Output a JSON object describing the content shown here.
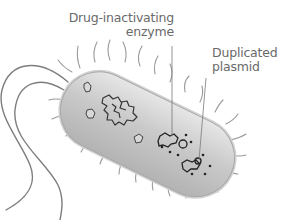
{
  "diagram": {
    "labels": [
      {
        "id": "enzyme",
        "lines": [
          "Drug-inactivating",
          "enzyme"
        ]
      },
      {
        "id": "plasmid",
        "lines": [
          "Duplicated",
          "plasmid"
        ]
      }
    ],
    "colors": {
      "label_text": "#6a6a6a",
      "leader_line": "#7a7a7a",
      "cell_body": "#c8c8c8",
      "cell_outline": "#a0a0a0",
      "dna_outline": "#333333",
      "pili": "#8c8c8c"
    }
  }
}
